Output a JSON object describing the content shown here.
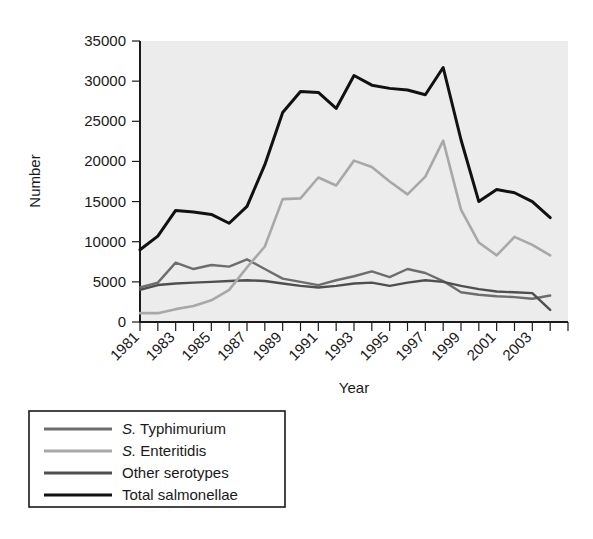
{
  "chart_data": {
    "type": "line",
    "title": "",
    "xlabel": "Year",
    "ylabel": "Number",
    "xlim": [
      1981,
      2005
    ],
    "ylim": [
      0,
      35000
    ],
    "grid": false,
    "legend_position": "below-left",
    "x": [
      1981,
      1982,
      1983,
      1984,
      1985,
      1986,
      1987,
      1988,
      1989,
      1990,
      1991,
      1992,
      1993,
      1994,
      1995,
      1996,
      1997,
      1998,
      1999,
      2000,
      2001,
      2002,
      2003,
      2004
    ],
    "xtick_values": [
      1981,
      1983,
      1985,
      1987,
      1989,
      1991,
      1993,
      1995,
      1997,
      1999,
      2001,
      2003
    ],
    "xtick_labels": [
      "1981",
      "1983",
      "1985",
      "1987",
      "1989",
      "1991",
      "1993",
      "1995",
      "1997",
      "1999",
      "2001",
      "2003"
    ],
    "ytick_values": [
      0,
      5000,
      10000,
      15000,
      20000,
      25000,
      30000,
      35000
    ],
    "ytick_labels": [
      "0",
      "5000",
      "10000",
      "15000",
      "20000",
      "25000",
      "30000",
      "35000"
    ],
    "series": [
      {
        "name": "S. Typhimurium",
        "legend_label_italic": "S.",
        "legend_label_rest": " Typhimurium",
        "color": "#6d6d6d",
        "width": 2.4,
        "values": [
          4300,
          4900,
          7400,
          6600,
          7100,
          6900,
          7800,
          6600,
          5400,
          5000,
          4600,
          5200,
          5700,
          6300,
          5600,
          6600,
          6100,
          5100,
          3700,
          3400,
          3200,
          3100,
          2900,
          3300
        ]
      },
      {
        "name": "S. Enteritidis",
        "legend_label_italic": "S.",
        "legend_label_rest": " Enteritidis",
        "color": "#a8a8a8",
        "width": 2.6,
        "values": [
          1100,
          1100,
          1600,
          2000,
          2700,
          4000,
          6800,
          9400,
          15300,
          15400,
          18000,
          17000,
          20100,
          19300,
          17500,
          15900,
          18100,
          22600,
          14000,
          9900,
          8300,
          10600,
          9600,
          8300
        ]
      },
      {
        "name": "Other serotypes",
        "legend_label_italic": "",
        "legend_label_rest": "Other serotypes",
        "color": "#4f4f4f",
        "width": 2.4,
        "values": [
          4000,
          4600,
          4800,
          4900,
          5000,
          5100,
          5200,
          5100,
          4800,
          4500,
          4300,
          4500,
          4800,
          4900,
          4500,
          4900,
          5200,
          5000,
          4500,
          4100,
          3800,
          3700,
          3600,
          1500
        ]
      },
      {
        "name": "Total salmonellae",
        "legend_label_italic": "",
        "legend_label_rest": "Total salmonellae",
        "color": "#111111",
        "width": 3.0,
        "values": [
          9000,
          10700,
          13900,
          13700,
          13400,
          12300,
          14400,
          19600,
          26100,
          28700,
          28600,
          26600,
          30700,
          29500,
          29100,
          28900,
          28300,
          31700,
          22700,
          15000,
          16500,
          16100,
          15000,
          13000
        ]
      }
    ]
  },
  "axis": {
    "ylabel": "Number",
    "xlabel": "Year"
  },
  "legend": {
    "items": [
      {
        "italic": "S.",
        "rest": " Typhimurium",
        "color": "#6d6d6d"
      },
      {
        "italic": "S.",
        "rest": " Enteritidis",
        "color": "#a8a8a8"
      },
      {
        "italic": "",
        "rest": "Other serotypes",
        "color": "#4f4f4f"
      },
      {
        "italic": "",
        "rest": "Total salmonellae",
        "color": "#111111"
      }
    ]
  }
}
